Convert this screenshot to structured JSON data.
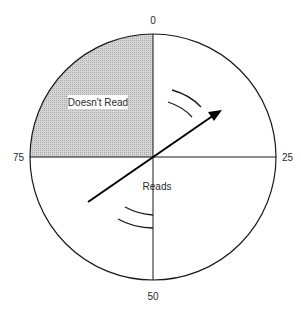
{
  "diagram": {
    "type": "dial",
    "center": [
      153,
      157
    ],
    "radius": 123,
    "scale_labels": {
      "top": "0",
      "right": "25",
      "bottom": "50",
      "left": "75"
    },
    "regions": [
      {
        "name": "Doesn't Read",
        "label": "Doesn't Read",
        "quadrant": "top-left",
        "range": [
          75,
          100
        ],
        "fill": "#c8c8c8"
      },
      {
        "name": "Reads",
        "label": "Reads",
        "range": [
          0,
          75
        ]
      }
    ],
    "pointer": {
      "from": [
        88,
        202
      ],
      "to": [
        222,
        110
      ],
      "color": "#000000"
    },
    "motion_arcs": [
      {
        "location": "upper-right",
        "count": 2
      },
      {
        "location": "lower-center",
        "count": 2
      }
    ]
  }
}
